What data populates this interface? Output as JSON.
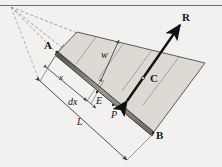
{
  "figure": {
    "kind": "engineering-diagram",
    "title_visible": false,
    "canvas": {
      "width": 222,
      "height": 167
    },
    "background_color": "#f2f1ef",
    "line_color": "#3a3a3a",
    "plate_fill": "#dedad4",
    "bar_fill": "#8d8a84",
    "bar_edge": "#2b2b2b",
    "vector_color": "#141414",
    "dashed_color": "#8c8a86"
  },
  "labels": {
    "point_A": "A",
    "point_B": "B",
    "point_C": "C",
    "point_E": "E",
    "point_P": "P",
    "vector_R": "R",
    "dim_w": "w",
    "dim_x": "x",
    "dim_dx": "dx",
    "dim_L": "L"
  },
  "geometry": {
    "apex": {
      "x": 11,
      "y": 7,
      "name": "perspective-vertex"
    },
    "plate_corners": [
      {
        "name": "A",
        "x": 57,
        "y": 52
      },
      {
        "name": "top-right",
        "x": 205,
        "y": 63
      },
      {
        "name": "B",
        "x": 153,
        "y": 133
      },
      {
        "name": "top-mid",
        "x": 77,
        "y": 32
      }
    ],
    "bar_from": {
      "name": "A",
      "x": 57,
      "y": 53
    },
    "bar_to": {
      "name": "B",
      "x": 153,
      "y": 134
    },
    "vector_R_tail": {
      "x": 127,
      "y": 101
    },
    "vector_R_head": {
      "x": 180,
      "y": 25
    },
    "dim_L_from": {
      "x": 39,
      "y": 80
    },
    "dim_L_to": {
      "x": 127,
      "y": 160
    },
    "dim_x_from": {
      "x": 46,
      "y": 67
    },
    "dim_x_to": {
      "x": 86,
      "y": 100
    },
    "dim_dx_span": {
      "from_x": 84,
      "from_y": 97,
      "to_x": 94,
      "to_y": 106
    },
    "dim_w_from": {
      "x": 102,
      "y": 77
    },
    "dim_w_to": {
      "x": 118,
      "y": 41
    }
  },
  "label_positions": {
    "A": {
      "x": 45,
      "y": 45
    },
    "B": {
      "x": 155,
      "y": 135
    },
    "C": {
      "x": 150,
      "y": 78
    },
    "E": {
      "x": 96,
      "y": 100
    },
    "P": {
      "x": 113,
      "y": 113
    },
    "R": {
      "x": 182,
      "y": 16
    },
    "w": {
      "x": 102,
      "y": 52
    },
    "x": {
      "x": 59,
      "y": 76
    },
    "dx": {
      "x": 71,
      "y": 100
    },
    "L": {
      "x": 78,
      "y": 120
    }
  }
}
